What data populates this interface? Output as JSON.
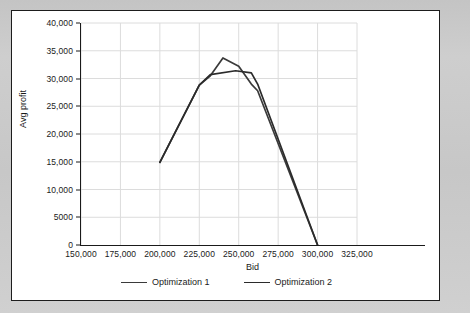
{
  "chart_data": {
    "type": "line",
    "title": "",
    "xlabel": "Bid",
    "ylabel": "Avg profit",
    "xlim": [
      150000,
      325000
    ],
    "ylim": [
      0,
      40000
    ],
    "grid": true,
    "legend_position": "bottom",
    "x_ticks": [
      "150,000",
      "175,000",
      "200,000",
      "225,000",
      "250,000",
      "275,000",
      "300,000",
      "325,000"
    ],
    "x_tick_values": [
      150000,
      175000,
      200000,
      225000,
      250000,
      275000,
      300000,
      325000
    ],
    "y_ticks": [
      "0",
      "5000",
      "10,000",
      "15,000",
      "20,000",
      "25,000",
      "30,000",
      "35,000",
      "40,000"
    ],
    "y_tick_values": [
      0,
      5000,
      10000,
      15000,
      20000,
      25000,
      30000,
      35000,
      40000
    ],
    "series": [
      {
        "name": "Optimization 1",
        "color": "#3a3a3a",
        "x": [
          200000,
          225000,
          232000,
          240000,
          250000,
          258000,
          262000,
          300000
        ],
        "values": [
          14900,
          28800,
          30500,
          33700,
          32200,
          29000,
          27800,
          0
        ]
      },
      {
        "name": "Optimization 2",
        "color": "#2b2b2b",
        "x": [
          200000,
          225000,
          232000,
          248000,
          258000,
          262000,
          300000
        ],
        "values": [
          14900,
          28800,
          30700,
          31400,
          31000,
          29000,
          0
        ]
      }
    ],
    "annotations": []
  },
  "legend": {
    "entries": [
      {
        "label": "Optimization 1"
      },
      {
        "label": "Optimization 2"
      }
    ]
  },
  "colors": {
    "panel_background": "#ffffff",
    "page_background": "#c9c9c9",
    "axis": "#1a1a1a",
    "grid": "#dcdcdc",
    "series_1": "#3a3a3a",
    "series_2": "#2b2b2b"
  }
}
